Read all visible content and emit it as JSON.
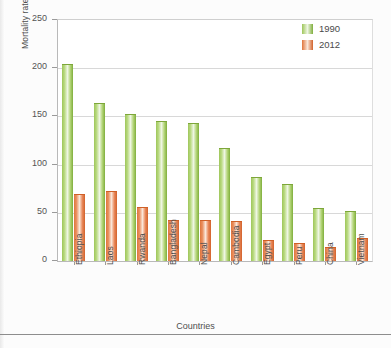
{
  "chart_data": {
    "type": "bar",
    "title": "",
    "xlabel": "Countries",
    "ylabel": "Mortality rate, per 1,000 live births",
    "ylim": [
      0,
      250
    ],
    "yticks": [
      0,
      50,
      100,
      150,
      200,
      250
    ],
    "grid": true,
    "legend_position": "top-right",
    "categories": [
      "Ethiopia",
      "Laos",
      "Rwanda",
      "Bangladesh",
      "Nepal",
      "Cambodia",
      "Egypt",
      "Peru",
      "China",
      "Vietnam"
    ],
    "series": [
      {
        "name": "1990",
        "color": "#8CBF4A",
        "values": [
          203,
          163,
          151,
          144,
          142,
          116,
          86,
          79,
          54,
          51
        ]
      },
      {
        "name": "2012",
        "color": "#E4793F",
        "values": [
          68,
          72,
          55,
          41,
          42,
          40,
          21,
          18,
          14,
          23
        ]
      }
    ]
  },
  "axes": {
    "y_title": "Mortality rate, per 1,000 live births",
    "x_title": "Countries",
    "y_tick_labels": [
      "250",
      "200",
      "150",
      "100",
      "50",
      "0"
    ]
  },
  "legend": {
    "items": [
      {
        "label": "1990",
        "swatch": "green-swatch-icon"
      },
      {
        "label": "2012",
        "swatch": "orange-swatch-icon"
      }
    ]
  }
}
